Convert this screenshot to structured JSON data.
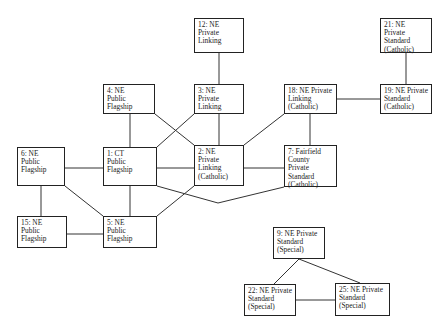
{
  "diagram": {
    "type": "network",
    "line_color": "#333333",
    "nodes": [
      {
        "id": "12",
        "label": "12: NE\nPrivate\nLinking",
        "x": 194,
        "y": 18,
        "w": 50,
        "h": 35
      },
      {
        "id": "21",
        "label": "21: NE\nPrivate\nStandard\n(Catholic)",
        "x": 380,
        "y": 18,
        "w": 52,
        "h": 35
      },
      {
        "id": "4",
        "label": "4: NE\nPublic\nFlagship",
        "x": 103,
        "y": 84,
        "w": 52,
        "h": 30
      },
      {
        "id": "3",
        "label": "3: NE\nPrivate\nLinking",
        "x": 194,
        "y": 84,
        "w": 50,
        "h": 30
      },
      {
        "id": "18",
        "label": "18: NE Private\nLinking\n(Catholic)",
        "x": 284,
        "y": 84,
        "w": 53,
        "h": 30
      },
      {
        "id": "19",
        "label": "19: NE Private\nStandard\n(Catholic)",
        "x": 380,
        "y": 84,
        "w": 52,
        "h": 30
      },
      {
        "id": "6",
        "label": "6: NE\nPublic\nFlagship",
        "x": 17,
        "y": 147,
        "w": 48,
        "h": 39
      },
      {
        "id": "1",
        "label": "1: CT\nPublic\nFlagship",
        "x": 103,
        "y": 147,
        "w": 54,
        "h": 39
      },
      {
        "id": "2",
        "label": "2: NE\nPrivate\nLinking\n(Catholic)",
        "x": 194,
        "y": 145,
        "w": 50,
        "h": 41
      },
      {
        "id": "7",
        "label": "7: Fairfield\nCounty\nPrivate\nStandard\n(Catholic)",
        "x": 284,
        "y": 145,
        "w": 53,
        "h": 42
      },
      {
        "id": "15",
        "label": "15: NE\nPublic\nFlagship",
        "x": 17,
        "y": 216,
        "w": 50,
        "h": 32
      },
      {
        "id": "5",
        "label": "5: NE\nPublic\nFlagship",
        "x": 103,
        "y": 216,
        "w": 54,
        "h": 32
      },
      {
        "id": "9",
        "label": "9: NE Private\nStandard\n(Special)",
        "x": 273,
        "y": 227,
        "w": 52,
        "h": 32
      },
      {
        "id": "22",
        "label": "22: NE Private\nStandard\n(Special)",
        "x": 244,
        "y": 284,
        "w": 52,
        "h": 32
      },
      {
        "id": "25",
        "label": "25: NE Private\nStandard\n(Special)",
        "x": 335,
        "y": 283,
        "w": 55,
        "h": 33
      }
    ],
    "edges": [
      {
        "from": "12",
        "to": "3",
        "points": [
          [
            219,
            53
          ],
          [
            219,
            84
          ]
        ]
      },
      {
        "from": "21",
        "to": "19",
        "points": [
          [
            406,
            53
          ],
          [
            406,
            84
          ]
        ]
      },
      {
        "from": "18",
        "to": "19",
        "points": [
          [
            337,
            99
          ],
          [
            380,
            99
          ]
        ]
      },
      {
        "from": "4",
        "to": "1",
        "points": [
          [
            130,
            114
          ],
          [
            130,
            147
          ]
        ]
      },
      {
        "from": "4",
        "to": "2",
        "points": [
          [
            155,
            114
          ],
          [
            194,
            145
          ]
        ]
      },
      {
        "from": "3",
        "to": "1",
        "points": [
          [
            194,
            114
          ],
          [
            157,
            147
          ]
        ]
      },
      {
        "from": "3",
        "to": "2",
        "points": [
          [
            219,
            114
          ],
          [
            219,
            145
          ]
        ]
      },
      {
        "from": "18",
        "to": "2",
        "points": [
          [
            284,
            114
          ],
          [
            244,
            145
          ]
        ]
      },
      {
        "from": "18",
        "to": "7",
        "points": [
          [
            310,
            114
          ],
          [
            310,
            145
          ]
        ]
      },
      {
        "from": "6",
        "to": "1",
        "points": [
          [
            65,
            168
          ],
          [
            103,
            168
          ]
        ]
      },
      {
        "from": "1",
        "to": "2",
        "points": [
          [
            157,
            168
          ],
          [
            194,
            168
          ]
        ]
      },
      {
        "from": "2",
        "to": "7",
        "points": [
          [
            244,
            168
          ],
          [
            284,
            168
          ]
        ]
      },
      {
        "from": "1",
        "to": "7",
        "points": [
          [
            157,
            186
          ],
          [
            218,
            203
          ],
          [
            284,
            187
          ]
        ]
      },
      {
        "from": "6",
        "to": "15",
        "points": [
          [
            41,
            186
          ],
          [
            41,
            216
          ]
        ]
      },
      {
        "from": "6",
        "to": "5",
        "points": [
          [
            65,
            186
          ],
          [
            103,
            216
          ]
        ]
      },
      {
        "from": "1",
        "to": "5",
        "points": [
          [
            130,
            186
          ],
          [
            130,
            216
          ]
        ]
      },
      {
        "from": "2",
        "to": "5",
        "points": [
          [
            194,
            186
          ],
          [
            157,
            216
          ]
        ]
      },
      {
        "from": "15",
        "to": "5",
        "points": [
          [
            67,
            234
          ],
          [
            103,
            234
          ]
        ]
      },
      {
        "from": "9",
        "to": "22",
        "points": [
          [
            299,
            259
          ],
          [
            274,
            284
          ]
        ]
      },
      {
        "from": "9",
        "to": "25",
        "points": [
          [
            299,
            259
          ],
          [
            360,
            283
          ]
        ]
      },
      {
        "from": "22",
        "to": "25",
        "points": [
          [
            296,
            300
          ],
          [
            335,
            300
          ]
        ]
      }
    ]
  }
}
